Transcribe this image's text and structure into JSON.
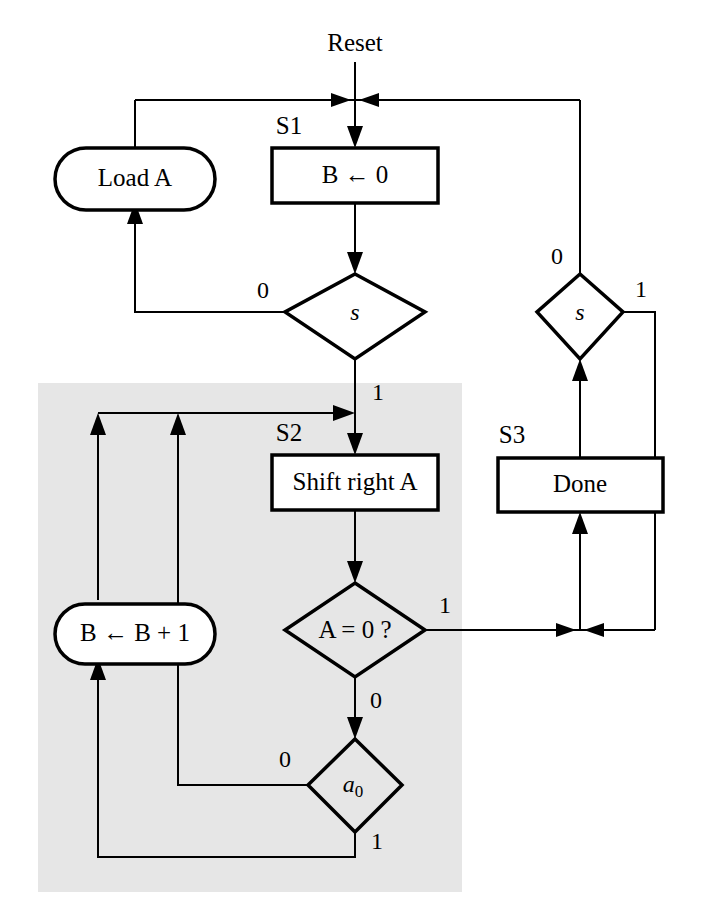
{
  "diagram": {
    "title": "Reset",
    "kind": "asm-flowchart",
    "canvas": {
      "width": 718,
      "height": 922
    },
    "colors": {
      "background": "#ffffff",
      "shaded_region": "#e6e6e6",
      "stroke": "#000000"
    },
    "entry_label": "Reset",
    "state_labels": {
      "s1": "S1",
      "s2": "S2",
      "s3": "S3"
    },
    "nodes": {
      "load_a": {
        "label": "Load A",
        "shape": "stadium"
      },
      "b_clear": {
        "label": "B ← 0",
        "shape": "rect"
      },
      "decision_s_left": {
        "label": "s",
        "shape": "diamond"
      },
      "decision_s_right": {
        "label": "s",
        "shape": "diamond"
      },
      "shift_right_a": {
        "label": "Shift right A",
        "shape": "rect"
      },
      "done": {
        "label": "Done",
        "shape": "rect"
      },
      "decision_a_zero": {
        "label": "A = 0 ?",
        "shape": "diamond"
      },
      "decision_a0": {
        "label": "a",
        "sub": "0",
        "shape": "diamond"
      },
      "b_increment": {
        "label": "B ← B + 1",
        "shape": "stadium"
      }
    },
    "edge_labels": {
      "s_left_false": "0",
      "s_left_true": "1",
      "s_right_false": "0",
      "s_right_true": "1",
      "a_zero_true": "1",
      "a_zero_false": "0",
      "a0_false": "0",
      "a0_true": "1"
    }
  }
}
